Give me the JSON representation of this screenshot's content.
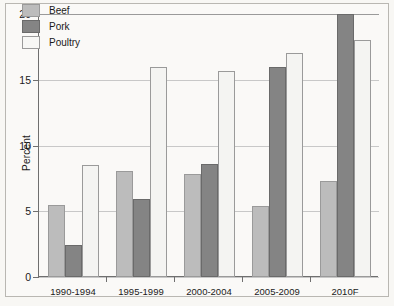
{
  "chart_data": {
    "type": "bar",
    "title": "",
    "xlabel": "",
    "ylabel": "Percent",
    "ylim": [
      0,
      20
    ],
    "yticks": [
      0,
      5,
      10,
      15,
      20
    ],
    "grid": true,
    "legend_position": "upper-left-inside",
    "categories": [
      "1990-1994",
      "1995-1999",
      "2000-2004",
      "2005-2009",
      "2010F"
    ],
    "series": [
      {
        "name": "Beef",
        "color": "#bcbcbc",
        "values": [
          5.5,
          8.1,
          7.8,
          5.4,
          7.3
        ]
      },
      {
        "name": "Pork",
        "color": "#848484",
        "values": [
          2.4,
          5.9,
          8.6,
          16.0,
          20.0
        ]
      },
      {
        "name": "Poultry",
        "color": "#f4f4f2",
        "values": [
          8.5,
          16.0,
          15.7,
          17.0,
          18.0
        ]
      }
    ]
  },
  "axis": {
    "y_title": "Percent",
    "y_tick_labels": [
      "20",
      "15",
      "10",
      "5",
      "0"
    ]
  },
  "legend": {
    "items": [
      {
        "label": "Beef"
      },
      {
        "label": "Pork"
      },
      {
        "label": "Poultry"
      }
    ]
  }
}
